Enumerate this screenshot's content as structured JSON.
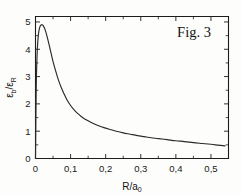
{
  "figure": {
    "annotation": "Fig. 3",
    "background_color": "#fdfdfc",
    "line_color": "#2a2a2a",
    "axis_color": "#1c1c1c"
  },
  "chart_data": {
    "type": "line",
    "title": "",
    "annotation": "Fig. 3",
    "xlabel": "R/a0",
    "xlabel_parts": {
      "numerator": "R",
      "slash": "/",
      "denominator": "a",
      "denominator_sub": "0"
    },
    "ylabel": "eb/eR",
    "ylabel_parts": {
      "numerator": "ε",
      "numerator_sub": "b",
      "slash": "/",
      "denominator": "ε",
      "denominator_sub": "R"
    },
    "xlim": [
      0,
      0.55
    ],
    "ylim": [
      0,
      5.2
    ],
    "xticks": [
      0,
      0.1,
      0.2,
      0.3,
      0.4,
      0.5
    ],
    "xticklabels": [
      "0",
      "0,1",
      "0,2",
      "0,3",
      "0,4",
      "0,5"
    ],
    "xticks_minor": [
      0.05,
      0.15,
      0.25,
      0.35,
      0.45
    ],
    "yticks": [
      0,
      1,
      2,
      3,
      4,
      5
    ],
    "yticklabels": [
      "0",
      "1",
      "2",
      "3",
      "4",
      "5"
    ],
    "grid": false,
    "legend": false,
    "frame": "box",
    "tick_direction": "in",
    "series": [
      {
        "name": "binding energy ratio",
        "x": [
          0.0,
          0.002,
          0.004,
          0.006,
          0.008,
          0.01,
          0.012,
          0.014,
          0.016,
          0.018,
          0.02,
          0.022,
          0.024,
          0.026,
          0.028,
          0.03,
          0.034,
          0.038,
          0.042,
          0.046,
          0.05,
          0.056,
          0.062,
          0.068,
          0.074,
          0.08,
          0.09,
          0.1,
          0.11,
          0.12,
          0.13,
          0.14,
          0.15,
          0.165,
          0.18,
          0.195,
          0.21,
          0.23,
          0.25,
          0.27,
          0.29,
          0.31,
          0.33,
          0.35,
          0.375,
          0.4,
          0.425,
          0.45,
          0.475,
          0.5,
          0.52,
          0.54
        ],
        "y": [
          0.0,
          2.55,
          3.62,
          4.18,
          4.5,
          4.69,
          4.8,
          4.86,
          4.89,
          4.9,
          4.89,
          4.86,
          4.82,
          4.76,
          4.69,
          4.61,
          4.42,
          4.21,
          3.99,
          3.77,
          3.55,
          3.27,
          3.01,
          2.78,
          2.58,
          2.4,
          2.14,
          1.94,
          1.78,
          1.65,
          1.54,
          1.45,
          1.38,
          1.28,
          1.2,
          1.13,
          1.07,
          1.0,
          0.94,
          0.89,
          0.84,
          0.8,
          0.76,
          0.73,
          0.69,
          0.65,
          0.62,
          0.58,
          0.55,
          0.52,
          0.49,
          0.46
        ]
      }
    ]
  }
}
